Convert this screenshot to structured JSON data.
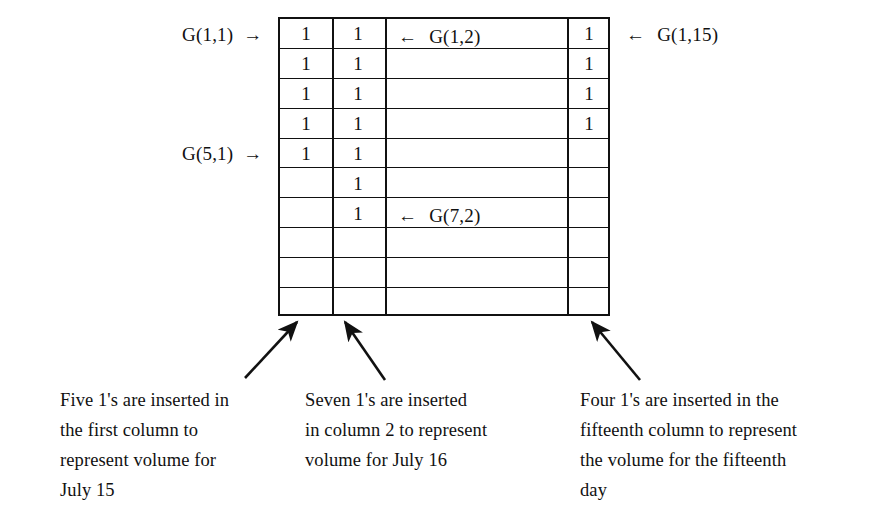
{
  "figure": {
    "type": "grid-diagram",
    "grid": {
      "rows": 10,
      "visible_columns": 4,
      "column_dividers_px": [
        278,
        330,
        383,
        565,
        610
      ],
      "cell_value": "1",
      "columns": [
        {
          "name": "column-1",
          "label": "first column",
          "ones_count": 5,
          "rows_filled": [
            1,
            2,
            3,
            4,
            5
          ]
        },
        {
          "name": "column-2",
          "label": "column 2",
          "ones_count": 7,
          "rows_filled": [
            1,
            2,
            3,
            4,
            5,
            6,
            7
          ]
        },
        {
          "name": "column-middle-gap",
          "label": "columns 3-14",
          "ones_count": 0,
          "rows_filled": []
        },
        {
          "name": "column-15",
          "label": "fifteenth column",
          "ones_count": 4,
          "rows_filled": [
            1,
            2,
            3,
            4
          ]
        }
      ]
    },
    "labels": {
      "g_1_1": "G(1,1)",
      "g_5_1": "G(5,1)",
      "g_1_2": "G(1,2)",
      "g_7_2": "G(7,2)",
      "g_1_15": "G(1,15)",
      "arrow_right": "→",
      "arrow_left": "←"
    },
    "captions": [
      {
        "id": "caption-column-1",
        "text": "Five 1's are inserted in\nthe first column to\nrepresent volume for\nJuly 15"
      },
      {
        "id": "caption-column-2",
        "text": "Seven 1's are inserted\nin column 2 to represent\nvolume for July 16"
      },
      {
        "id": "caption-column-15",
        "text": "Four 1's are inserted in the\nfifteenth column to represent\nthe volume for the fifteenth\nday"
      }
    ],
    "colors": {
      "ink": "#111111",
      "paper": "#ffffff"
    }
  }
}
